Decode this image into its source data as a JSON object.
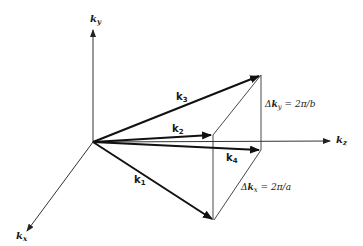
{
  "diagram": {
    "type": "vector-diagram",
    "axes": [
      {
        "id": "ky",
        "label": "k",
        "subscript": "y",
        "direction": "up"
      },
      {
        "id": "kz",
        "label": "k",
        "subscript": "z",
        "direction": "right"
      },
      {
        "id": "kx",
        "label": "k",
        "subscript": "x",
        "direction": "down-left"
      }
    ],
    "vectors": [
      {
        "id": "k1",
        "label": "k",
        "subscript": "1"
      },
      {
        "id": "k2",
        "label": "k",
        "subscript": "2"
      },
      {
        "id": "k3",
        "label": "k",
        "subscript": "3"
      },
      {
        "id": "k4",
        "label": "k",
        "subscript": "4"
      }
    ],
    "annotations": [
      {
        "id": "delta-ky",
        "prefix": "Δ",
        "var": "k",
        "subscript": "y",
        "rhs": " = 2π/b"
      },
      {
        "id": "delta-kx",
        "prefix": "Δ",
        "var": "k",
        "subscript": "x",
        "rhs": " = 2π/a"
      }
    ]
  }
}
